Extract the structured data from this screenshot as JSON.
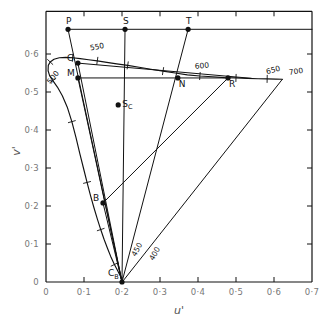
{
  "figure": {
    "type": "chromaticity-diagram",
    "xlabel": "u'",
    "ylabel": "v'"
  },
  "chart_data": {
    "type": "scatter",
    "title": "",
    "xlabel": "u'",
    "ylabel": "v'",
    "xlim": [
      0,
      0.7
    ],
    "ylim": [
      0,
      0.665
    ],
    "grid": false,
    "legend": "none",
    "xticks": [
      "0",
      "0·1",
      "0·2",
      "0·3",
      "0·4",
      "0·5",
      "0·6",
      "0·7"
    ],
    "xtick_values": [
      0,
      0.1,
      0.2,
      0.3,
      0.4,
      0.5,
      0.6,
      0.7
    ],
    "yticks": [
      "0",
      "0·1",
      "0·2",
      "0·3",
      "0·4",
      "0·5",
      "0·6"
    ],
    "ytick_values": [
      0,
      0.1,
      0.2,
      0.3,
      0.4,
      0.5,
      0.6
    ],
    "points": [
      {
        "label": "P",
        "u": 0.058,
        "v": 0.665,
        "label_dx": -2,
        "label_dy": -5
      },
      {
        "label": "S",
        "u": 0.208,
        "v": 0.665,
        "label_dx": -2,
        "label_dy": -5
      },
      {
        "label": "T",
        "u": 0.374,
        "v": 0.665,
        "label_dx": -2,
        "label_dy": -5
      },
      {
        "label": "G",
        "u": 0.084,
        "v": 0.576,
        "label_dx": -11,
        "label_dy": -2
      },
      {
        "label": "M",
        "u": 0.084,
        "v": 0.537,
        "label_dx": -11,
        "label_dy": -2
      },
      {
        "label": "N",
        "u": 0.347,
        "v": 0.537,
        "label_dx": 1,
        "label_dy": 9
      },
      {
        "label": "R",
        "u": 0.479,
        "v": 0.537,
        "label_dx": 1,
        "label_dy": 9
      },
      {
        "label": "B",
        "u": 0.15,
        "v": 0.208,
        "label_dx": -10,
        "label_dy": -2
      },
      {
        "label": "S",
        "sub": "C",
        "u": 0.19,
        "v": 0.466,
        "label_dx": 4,
        "label_dy": 2
      },
      {
        "label": "C",
        "sub": "B",
        "u": 0.2,
        "v": 0.0,
        "label_dx": -14,
        "label_dy": -6
      }
    ],
    "wavelength_labels": [
      {
        "text": "500",
        "u": 0.012,
        "v": 0.52,
        "rot": -52
      },
      {
        "text": "550",
        "u": 0.117,
        "v": 0.609,
        "rot": -11
      },
      {
        "text": "600",
        "u": 0.392,
        "v": 0.561,
        "rot": -5
      },
      {
        "text": "650",
        "u": 0.581,
        "v": 0.547,
        "rot": -14
      },
      {
        "text": "700",
        "u": 0.64,
        "v": 0.545,
        "rot": -8
      },
      {
        "text": "450",
        "u": 0.236,
        "v": 0.066,
        "rot": -62
      },
      {
        "text": "400",
        "u": 0.283,
        "v": 0.055,
        "rot": -62
      }
    ],
    "series": [
      {
        "name": "spectral-locus",
        "kind": "curve",
        "closed": true,
        "points": [
          [
            0.2005,
            0.0
          ],
          [
            0.196,
            0.015
          ],
          [
            0.188,
            0.031
          ],
          [
            0.18,
            0.046
          ],
          [
            0.17,
            0.068
          ],
          [
            0.162,
            0.088
          ],
          [
            0.153,
            0.112
          ],
          [
            0.144,
            0.138
          ],
          [
            0.135,
            0.166
          ],
          [
            0.126,
            0.196
          ],
          [
            0.117,
            0.228
          ],
          [
            0.108,
            0.262
          ],
          [
            0.099,
            0.298
          ],
          [
            0.089,
            0.338
          ],
          [
            0.079,
            0.38
          ],
          [
            0.068,
            0.422
          ],
          [
            0.056,
            0.46
          ],
          [
            0.043,
            0.49
          ],
          [
            0.03,
            0.513
          ],
          [
            0.018,
            0.53
          ],
          [
            0.0095,
            0.543
          ],
          [
            0.0055,
            0.556
          ],
          [
            0.006,
            0.57
          ],
          [
            0.011,
            0.579
          ],
          [
            0.021,
            0.586
          ],
          [
            0.035,
            0.59
          ],
          [
            0.052,
            0.591
          ],
          [
            0.07,
            0.59
          ],
          [
            0.09,
            0.588
          ],
          [
            0.112,
            0.585
          ],
          [
            0.135,
            0.582
          ],
          [
            0.16,
            0.578
          ],
          [
            0.186,
            0.574
          ],
          [
            0.215,
            0.57
          ],
          [
            0.245,
            0.565
          ],
          [
            0.276,
            0.56
          ],
          [
            0.308,
            0.555
          ],
          [
            0.34,
            0.55
          ],
          [
            0.372,
            0.545
          ],
          [
            0.405,
            0.542
          ],
          [
            0.438,
            0.54
          ],
          [
            0.47,
            0.538
          ],
          [
            0.5,
            0.537
          ],
          [
            0.53,
            0.536
          ],
          [
            0.558,
            0.535
          ],
          [
            0.582,
            0.5345
          ],
          [
            0.605,
            0.534
          ],
          [
            0.622,
            0.5335
          ]
        ]
      },
      {
        "name": "purple-line",
        "kind": "line",
        "points": [
          [
            0.622,
            0.5335
          ],
          [
            0.2005,
            0.0
          ]
        ]
      },
      {
        "name": "top-horizontal-PT",
        "kind": "line",
        "points": [
          [
            0.058,
            0.665
          ],
          [
            0.7,
            0.665
          ]
        ]
      },
      {
        "name": "horizontal-G-locus",
        "kind": "line",
        "points": [
          [
            0.084,
            0.576
          ],
          [
            0.54,
            0.536
          ]
        ]
      },
      {
        "name": "horizontal-M-R",
        "kind": "line",
        "points": [
          [
            0.084,
            0.537
          ],
          [
            0.479,
            0.537
          ]
        ]
      },
      {
        "name": "ray-P-CB",
        "kind": "line",
        "points": [
          [
            0.058,
            0.665
          ],
          [
            0.2,
            0.0
          ]
        ]
      },
      {
        "name": "ray-S-CB",
        "kind": "line",
        "points": [
          [
            0.208,
            0.665
          ],
          [
            0.2,
            0.0
          ]
        ]
      },
      {
        "name": "ray-T-CB",
        "kind": "line",
        "points": [
          [
            0.374,
            0.665
          ],
          [
            0.2,
            0.0
          ]
        ]
      },
      {
        "name": "ray-G-CB",
        "kind": "line",
        "points": [
          [
            0.084,
            0.576
          ],
          [
            0.2,
            0.0
          ]
        ]
      },
      {
        "name": "ray-M-CB",
        "kind": "line",
        "points": [
          [
            0.084,
            0.537
          ],
          [
            0.2,
            0.0
          ]
        ]
      },
      {
        "name": "ray-B-R",
        "kind": "line",
        "points": [
          [
            0.15,
            0.208
          ],
          [
            0.479,
            0.537
          ]
        ]
      },
      {
        "name": "ray-B-CB",
        "kind": "line",
        "points": [
          [
            0.15,
            0.208
          ],
          [
            0.2,
            0.0
          ]
        ]
      }
    ]
  }
}
